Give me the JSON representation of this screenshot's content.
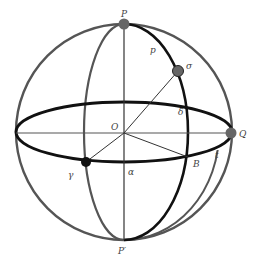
{
  "diagram": {
    "colors": {
      "outer_circle": "#555555",
      "equator": "#111111",
      "meridian_front": "#111111",
      "meridian_back": "#555555",
      "axis_lines": "#333333",
      "point_gray": "#666666",
      "point_black": "#111111"
    },
    "labels": {
      "north_pole": "P",
      "south_pole": "P′",
      "center": "O",
      "star": "σ",
      "polar_distance": "p",
      "declination": "δ",
      "q_point": "Q",
      "hour_angle": "t",
      "b_point": "B",
      "right_ascension": "α",
      "vernal_equinox": "γ"
    },
    "points": [
      {
        "name": "P",
        "x": 124,
        "y": 24,
        "style": "gray"
      },
      {
        "name": "σ",
        "x": 178,
        "y": 71,
        "style": "gray"
      },
      {
        "name": "Q",
        "x": 231,
        "y": 133,
        "style": "gray"
      },
      {
        "name": "γ",
        "x": 86,
        "y": 162,
        "style": "black"
      }
    ]
  }
}
